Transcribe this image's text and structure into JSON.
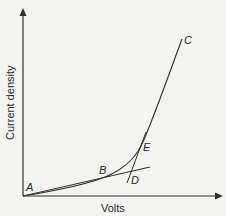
{
  "figure": {
    "type": "polarization-curve",
    "axes": {
      "y_label": "Current density",
      "x_label": "Volts"
    },
    "points": [
      {
        "id": "A",
        "label": "A"
      },
      {
        "id": "B",
        "label": "B"
      },
      {
        "id": "C",
        "label": "C"
      },
      {
        "id": "D",
        "label": "D"
      },
      {
        "id": "E",
        "label": "E"
      }
    ],
    "colors": {
      "background": "#f3f3f1",
      "line": "#2f2f2f",
      "text": "#2a2a2a"
    }
  }
}
